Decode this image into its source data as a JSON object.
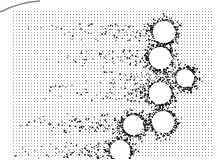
{
  "image": {
    "description": "Halftone micrograph-like image with white circular particles surrounded by dark speckle halos and streaks trailing left",
    "background_color": "#ffffff",
    "dot_color": "#9a9a9a",
    "speckle_color": "#111111",
    "field": {
      "x": 12,
      "y": 10,
      "width": 200,
      "height": 148
    },
    "particles": [
      {
        "cx": 164,
        "cy": 32,
        "r": 11
      },
      {
        "cx": 160,
        "cy": 58,
        "r": 11
      },
      {
        "cx": 185,
        "cy": 78,
        "r": 9
      },
      {
        "cx": 160,
        "cy": 93,
        "r": 11
      },
      {
        "cx": 163,
        "cy": 122,
        "r": 11
      },
      {
        "cx": 133,
        "cy": 125,
        "r": 10
      },
      {
        "cx": 120,
        "cy": 150,
        "r": 10
      }
    ]
  }
}
